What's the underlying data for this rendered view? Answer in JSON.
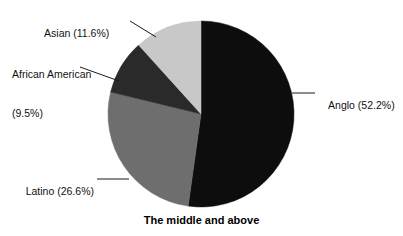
{
  "caption": "The middle and above",
  "chart_data": {
    "type": "pie",
    "title": "The middle and above",
    "xlabel": "",
    "ylabel": "",
    "legend_position": "none",
    "grid": false,
    "start_angle_deg": 0,
    "direction": "clockwise",
    "center": {
      "x": 201,
      "y": 114
    },
    "radius": 93,
    "categories": [
      "Anglo",
      "Latino",
      "African American",
      "Asian"
    ],
    "values": [
      52.2,
      26.6,
      9.5,
      11.6
    ],
    "value_unit": "%",
    "colors": [
      "#0d0d0d",
      "#6e6e6e",
      "#2a2a2a",
      "#c8c8c8"
    ],
    "slices": [
      {
        "name": "Anglo",
        "value": 52.2,
        "label": "Anglo (52.2%)",
        "color": "#0d0d0d",
        "start_deg": 0,
        "end_deg": 187.92
      },
      {
        "name": "Latino",
        "value": 26.6,
        "label": "Latino (26.6%)",
        "color": "#6e6e6e",
        "start_deg": 187.92,
        "end_deg": 283.68
      },
      {
        "name": "African American",
        "value": 9.5,
        "label": "African American\n(9.5%)",
        "color": "#2a2a2a",
        "start_deg": 283.68,
        "end_deg": 317.88
      },
      {
        "name": "Asian",
        "value": 11.6,
        "label": "Asian (11.6%)",
        "color": "#c8c8c8",
        "start_deg": 317.88,
        "end_deg": 360
      }
    ]
  },
  "labels": {
    "asian": "Asian (11.6%)",
    "african_american_line1": "African American",
    "african_american_line2": "(9.5%)",
    "latino": "Latino (26.6%)",
    "anglo": "Anglo (52.2%)"
  },
  "colors": {
    "anglo": "#0d0d0d",
    "latino": "#6e6e6e",
    "african_american": "#2a2a2a",
    "asian": "#c8c8c8",
    "leader_line": "#1a1a1a",
    "background": "#ffffff",
    "text": "#111111"
  }
}
